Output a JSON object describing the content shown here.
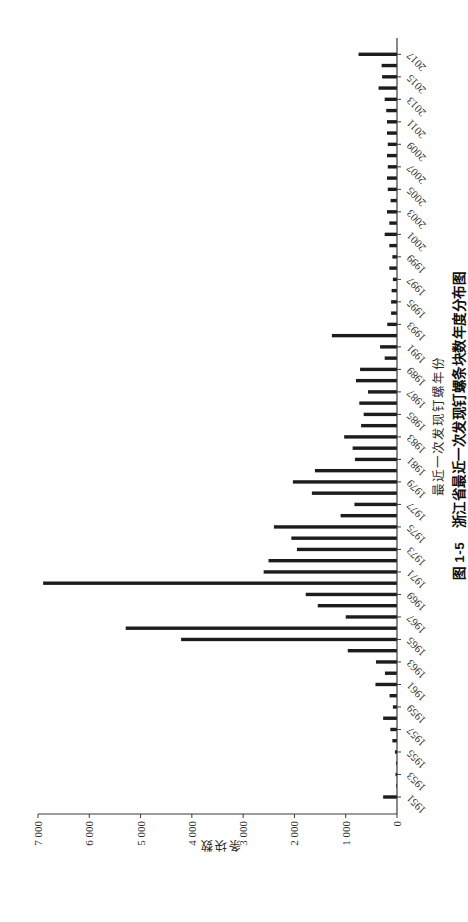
{
  "page": {
    "background": "#ffffff"
  },
  "figure": {
    "caption": "图 1-5　浙江省最近一次发现钉螺条块数年度分布图",
    "orientation": "chart rotated 90° counterclockwise to fit portrait page"
  },
  "chart_data": {
    "type": "bar",
    "title": "",
    "xlabel": "最近一次发现钉螺年份",
    "ylabel": "条块数",
    "categories": [
      1951,
      1952,
      1953,
      1954,
      1955,
      1956,
      1957,
      1958,
      1959,
      1960,
      1961,
      1962,
      1963,
      1964,
      1965,
      1966,
      1967,
      1968,
      1969,
      1970,
      1971,
      1972,
      1973,
      1974,
      1975,
      1976,
      1977,
      1978,
      1979,
      1980,
      1981,
      1982,
      1983,
      1984,
      1985,
      1986,
      1987,
      1988,
      1989,
      1990,
      1991,
      1992,
      1993,
      1994,
      1995,
      1996,
      1997,
      1998,
      1999,
      2000,
      2001,
      2002,
      2003,
      2004,
      2005,
      2006,
      2007,
      2008,
      2009,
      2010,
      2011,
      2012,
      2013,
      2014,
      2015,
      2016,
      2017
    ],
    "values": [
      270,
      15,
      30,
      20,
      40,
      90,
      130,
      270,
      80,
      145,
      420,
      235,
      410,
      960,
      4210,
      5290,
      1000,
      1545,
      1780,
      6900,
      2600,
      2505,
      1950,
      2060,
      2400,
      1100,
      830,
      1660,
      2030,
      1600,
      820,
      865,
      1030,
      700,
      650,
      735,
      565,
      800,
      720,
      240,
      330,
      1270,
      190,
      115,
      115,
      105,
      80,
      150,
      90,
      150,
      240,
      150,
      195,
      125,
      180,
      195,
      180,
      195,
      180,
      195,
      195,
      210,
      240,
      360,
      290,
      300,
      750
    ],
    "ylim": [
      0,
      7000
    ],
    "y_ticks": [
      0,
      1000,
      2000,
      3000,
      4000,
      5000,
      6000,
      7000
    ],
    "y_tick_labels": [
      "0",
      "1 000",
      "2 000",
      "3 000",
      "4 000",
      "5 000",
      "6 000",
      "7 000"
    ],
    "x_tick_label_years": [
      1951,
      1953,
      1955,
      1957,
      1959,
      1961,
      1963,
      1965,
      1967,
      1969,
      1971,
      1973,
      1975,
      1977,
      1979,
      1981,
      1983,
      1985,
      1987,
      1989,
      1991,
      1993,
      1995,
      1997,
      1999,
      2001,
      2003,
      2005,
      2007,
      2009,
      2011,
      2013,
      2015,
      2017
    ],
    "x_tick_label_rotation_deg": -45,
    "bar_color": "#1c1c1c",
    "axis_color": "#3a3a3a",
    "tick_label_color": "#2e2e2e",
    "grid": false,
    "legend": null
  }
}
